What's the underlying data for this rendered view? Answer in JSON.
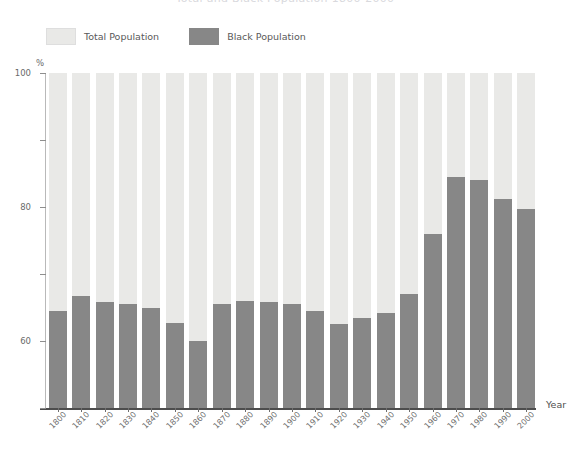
{
  "title": {
    "text": "Total and Black Population 1800-2000",
    "visible_state": "cropped-at-top-edge"
  },
  "legend": {
    "items": [
      {
        "label": "Total Population",
        "color": "#e9e9e7",
        "swatch": "light-gray-swatch"
      },
      {
        "label": "Black Population",
        "color": "#878787",
        "swatch": "dark-gray-swatch"
      }
    ]
  },
  "axes": {
    "y_unit": "%",
    "y_ticks": [
      "0",
      "20",
      "40",
      "60",
      "80",
      "100"
    ],
    "x_title": "Year"
  },
  "colors": {
    "total": "#e9e9e7",
    "black": "#878787",
    "axis": "#4d4d4d",
    "text": "#5a5a5a"
  },
  "chart_data": {
    "type": "bar",
    "title": "Total and Black Population 1800-2000",
    "subtitle": "",
    "xlabel": "Year",
    "ylabel": "%",
    "ylim": [
      0,
      100
    ],
    "yticks": [
      0,
      20,
      40,
      60,
      80,
      100
    ],
    "grid": false,
    "legend_position": "top-left",
    "stacked": true,
    "categories": [
      "1800",
      "1810",
      "1820",
      "1830",
      "1840",
      "1850",
      "1860",
      "1870",
      "1880",
      "1890",
      "1900",
      "1910",
      "1920",
      "1930",
      "1940",
      "1950",
      "1960",
      "1970",
      "1980",
      "1990",
      "2000"
    ],
    "series": [
      {
        "name": "Black Population",
        "color": "#878787",
        "values": [
          29,
          33.5,
          31.5,
          31,
          30,
          25.5,
          20,
          31,
          32,
          31.5,
          31,
          29,
          25,
          27,
          28.5,
          34,
          52,
          69,
          68,
          62.5,
          59.5
        ]
      },
      {
        "name": "Total Population",
        "color": "#e9e9e7",
        "values": [
          100,
          100,
          100,
          100,
          100,
          100,
          100,
          100,
          100,
          100,
          100,
          100,
          100,
          100,
          100,
          100,
          100,
          100,
          100,
          100,
          100
        ]
      }
    ]
  }
}
